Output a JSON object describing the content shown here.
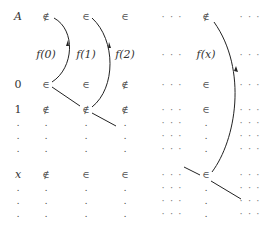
{
  "diagram": {
    "columns": [
      "A",
      "f(0)",
      "f(1)",
      "f(2)",
      "...",
      "f(x)",
      "..."
    ],
    "column_x": [
      60,
      100,
      140,
      180,
      220,
      261
    ],
    "header_row": {
      "label": "A",
      "cells": [
        "∉",
        "∈",
        "∈",
        "· · ·",
        "∉",
        "· · ·"
      ]
    },
    "function_row": {
      "cells": [
        "f(0)",
        "f(1)",
        "f(2)",
        "· · ·",
        "f(x)",
        "· · ·"
      ]
    },
    "rows": [
      {
        "label": "0",
        "cells": [
          "∈",
          "∈",
          "∉",
          "· · ·",
          "∈",
          "· · ·"
        ]
      },
      {
        "label": "1",
        "cells": [
          "∉",
          "∉",
          "∉",
          "· · ·",
          "∈",
          "· · ·"
        ]
      },
      {
        "label": ".",
        "cells": [
          ".",
          ".",
          ".",
          "· · ·",
          ".",
          "· · ·"
        ]
      },
      {
        "label": ".",
        "cells": [
          ".",
          ".",
          ".",
          "· · ·",
          ".",
          "· · ·"
        ]
      },
      {
        "label": ".",
        "cells": [
          ".",
          ".",
          ".",
          "· · ·",
          ".",
          "· · ·"
        ]
      },
      {
        "label": "x",
        "cells": [
          "∉",
          "∈",
          "∈",
          "· · ·",
          "∈",
          "· · ·"
        ]
      },
      {
        "label": ".",
        "cells": [
          ".",
          ".",
          ".",
          "· · ·",
          ".",
          "· · ·"
        ]
      },
      {
        "label": ".",
        "cells": [
          ".",
          ".",
          ".",
          "· · ·",
          ".",
          "· · ·"
        ]
      },
      {
        "label": ".",
        "cells": [
          ".",
          ".",
          ".",
          "· · ·",
          ".",
          "· · ·"
        ]
      }
    ],
    "line_color": "#222222"
  }
}
